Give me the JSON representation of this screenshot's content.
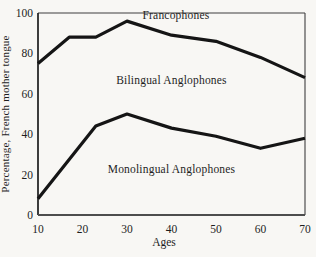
{
  "chart_data": {
    "type": "line",
    "title": "",
    "xlabel": "Ages",
    "ylabel": "Percentage, French mother tongue",
    "xlim": [
      10,
      70
    ],
    "ylim": [
      0,
      100
    ],
    "x_ticks": [
      10,
      20,
      30,
      40,
      50,
      60,
      70
    ],
    "y_ticks": [
      0,
      20,
      40,
      60,
      80,
      100
    ],
    "grid": false,
    "legend": "none",
    "series": [
      {
        "name": "francophones-bilingual-boundary",
        "points": [
          [
            10,
            75
          ],
          [
            17,
            88
          ],
          [
            23,
            88
          ],
          [
            30,
            96
          ],
          [
            40,
            89
          ],
          [
            50,
            86
          ],
          [
            60,
            78
          ],
          [
            70,
            68
          ]
        ]
      },
      {
        "name": "bilingual-monolingual-boundary",
        "points": [
          [
            10,
            8
          ],
          [
            23,
            44
          ],
          [
            30,
            50
          ],
          [
            40,
            43
          ],
          [
            50,
            39
          ],
          [
            60,
            33
          ],
          [
            70,
            38
          ]
        ]
      }
    ],
    "region_labels": [
      {
        "label": "Francophones",
        "age": 41,
        "value": 99
      },
      {
        "label": "Bilingual Anglophones",
        "age": 40,
        "value": 67
      },
      {
        "label": "Monolingual Anglophones",
        "age": 40,
        "value": 23
      }
    ]
  },
  "colors": {
    "background": "#f8f7f4",
    "curve": "#151515",
    "axis": "#1c1c1c",
    "baseline": "#4d4d4d",
    "frame": "#3f3f3f",
    "text": "#1e1e1e"
  }
}
